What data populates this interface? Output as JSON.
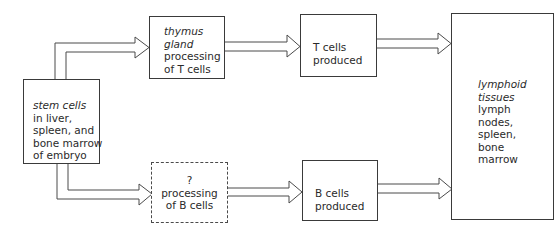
{
  "diagram": {
    "title": "",
    "nodes": {
      "stem_cells": {
        "heading": "stem cells",
        "lines": [
          "in liver,",
          "spleen, and",
          "bone marrow",
          "of embryo"
        ]
      },
      "thymus": {
        "heading_1": "thymus",
        "heading_2": "gland",
        "lines": [
          "processing",
          "of T cells"
        ]
      },
      "unknown": {
        "heading": "?",
        "lines": [
          "processing",
          "of B cells"
        ]
      },
      "t_cells": {
        "lines": [
          "T cells",
          "produced"
        ]
      },
      "b_cells": {
        "lines": [
          "B cells",
          "produced"
        ]
      },
      "lymphoid": {
        "heading_1": "lymphoid",
        "heading_2": "tissues",
        "lines": [
          "lymph",
          "nodes,",
          "spleen,",
          "bone",
          "marrow"
        ]
      }
    },
    "edges": [
      {
        "from": "stem_cells",
        "to": "thymus"
      },
      {
        "from": "stem_cells",
        "to": "unknown"
      },
      {
        "from": "thymus",
        "to": "t_cells"
      },
      {
        "from": "unknown",
        "to": "b_cells"
      },
      {
        "from": "t_cells",
        "to": "lymphoid"
      },
      {
        "from": "b_cells",
        "to": "lymphoid"
      }
    ],
    "colors": {
      "stroke": "#3a3a3a",
      "background": "#ffffff",
      "text": "#2a2a2a"
    }
  }
}
